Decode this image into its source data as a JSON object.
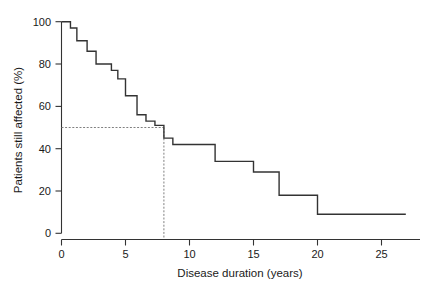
{
  "chart_data": {
    "type": "line",
    "subtype": "kaplan-meier-step",
    "title": "",
    "xlabel": "Disease duration (years)",
    "ylabel": "Patients still affected (%)",
    "xlim": [
      -0.4,
      27.6
    ],
    "ylim": [
      -2,
      103
    ],
    "xticks": [
      0,
      5,
      10,
      15,
      20,
      25
    ],
    "xtick_labels": [
      "0",
      "5",
      "10",
      "15",
      "20",
      "25"
    ],
    "yticks": [
      0,
      20,
      40,
      60,
      80,
      100
    ],
    "ytick_labels": [
      "0",
      "20",
      "40",
      "60",
      "80",
      "100"
    ],
    "grid": false,
    "legend": "none",
    "series": [
      {
        "name": "Patients still affected",
        "style": "step-post",
        "color": "#333333",
        "x": [
          0.0,
          0.7,
          1.2,
          2.0,
          2.7,
          3.9,
          4.4,
          5.0,
          5.9,
          6.6,
          7.3,
          8.0,
          8.7,
          12.0,
          15.0,
          17.0,
          20.0,
          26.9
        ],
        "y": [
          100,
          97,
          91,
          86,
          80,
          77,
          73,
          65,
          56,
          53,
          51,
          45,
          42,
          34,
          29,
          18,
          9,
          9
        ]
      }
    ],
    "annotations": [
      {
        "name": "median-guide",
        "type": "dashed-crosshair",
        "color": "#777777",
        "x": 8.0,
        "y": 50,
        "horizontal_from_x": 0.0,
        "vertical_to_y": 0
      }
    ]
  },
  "axes": {
    "x_title": "Disease duration (years)",
    "y_title": "Patients still affected (%)"
  }
}
